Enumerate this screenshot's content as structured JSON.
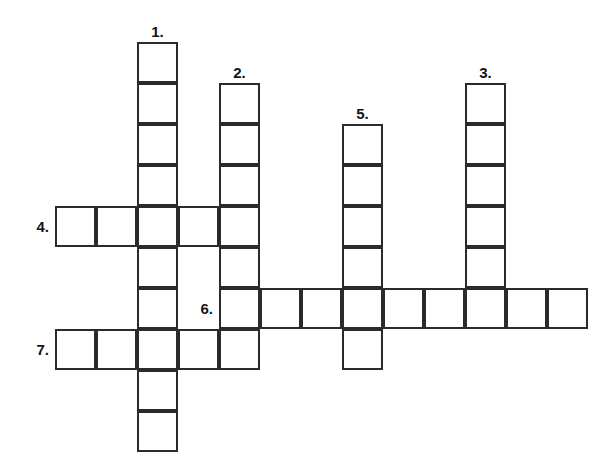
{
  "puzzle": {
    "title": "Crossword Grid",
    "cell_size": 41,
    "origin_x": 55,
    "origin_y": 42,
    "line_color": "#2b2b2b",
    "cell_fill": "#ffffff",
    "background": "#ffffff",
    "number_color": "#141414",
    "entries": [
      {
        "number": "1.",
        "direction": "down",
        "col": 2,
        "row": 0,
        "length": 10,
        "label_position": "above"
      },
      {
        "number": "2.",
        "direction": "down",
        "col": 4,
        "row": 1,
        "length": 7,
        "label_position": "above"
      },
      {
        "number": "3.",
        "direction": "down",
        "col": 10,
        "row": 1,
        "length": 6,
        "label_position": "above"
      },
      {
        "number": "4.",
        "direction": "across",
        "col": 0,
        "row": 4,
        "length": 4,
        "label_position": "left"
      },
      {
        "number": "5.",
        "direction": "down",
        "col": 7,
        "row": 2,
        "length": 6,
        "label_position": "above"
      },
      {
        "number": "6.",
        "direction": "across",
        "col": 4,
        "row": 6,
        "length": 9,
        "label_position": "left"
      },
      {
        "number": "7.",
        "direction": "across",
        "col": 0,
        "row": 7,
        "length": 4,
        "label_position": "left"
      }
    ]
  }
}
